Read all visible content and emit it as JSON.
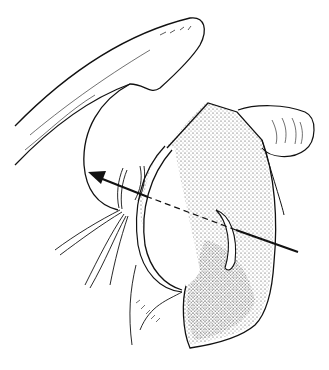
{
  "figure": {
    "type": "anatomical line illustration",
    "background": "#ffffff",
    "stroke_color": "#111111",
    "stipple_color": "#333333",
    "elements": [
      {
        "name": "acromion-arch",
        "description": "curved bony arch at top-left"
      },
      {
        "name": "humeral-head-outline",
        "description": "rounded outline under arch"
      },
      {
        "name": "glenoid-capsule",
        "description": "stippled oval joint structure with opened capsule"
      },
      {
        "name": "coracoid-process",
        "description": "rounded ridged structure at upper right"
      },
      {
        "name": "nerve-branches",
        "description": "fine lines fanning to lower-left"
      },
      {
        "name": "trajectory-arrow",
        "description": "arrow from lower right pointing up-left through joint, dashed where hidden"
      }
    ],
    "labels": []
  }
}
